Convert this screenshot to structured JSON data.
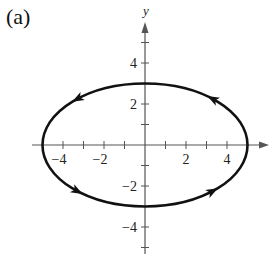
{
  "panel_label": "(a)",
  "chart_data": {
    "type": "line",
    "title": "",
    "panel": "(a)",
    "xlabel": "",
    "ylabel": "y",
    "xlim": [
      -5.5,
      5.5
    ],
    "ylim": [
      -5.5,
      5.5
    ],
    "grid": false,
    "x_ticks": [
      -4,
      -3,
      -2,
      -1,
      1,
      2,
      3,
      4
    ],
    "y_ticks": [
      -5,
      -4,
      -3,
      -2,
      -1,
      1,
      2,
      3,
      4,
      5
    ],
    "x_tick_labels": [
      "-4",
      "-2",
      "2",
      "4"
    ],
    "y_tick_labels": [
      "4",
      "2",
      "-2",
      "-4"
    ],
    "series": [
      {
        "name": "ellipse",
        "shape": "ellipse",
        "center": [
          0,
          0
        ],
        "semi_major_x": 5,
        "semi_minor_y": 3,
        "equation": "x^2/25 + y^2/9 = 1",
        "orientation": "counterclockwise",
        "direction_arrows": [
          {
            "x": 3.3,
            "y": 2.25,
            "direction": "up-left"
          },
          {
            "x": -3.3,
            "y": 2.25,
            "direction": "left-down"
          },
          {
            "x": -3.3,
            "y": -2.25,
            "direction": "down-right"
          },
          {
            "x": 3.3,
            "y": -2.25,
            "direction": "right-up"
          }
        ]
      }
    ]
  }
}
